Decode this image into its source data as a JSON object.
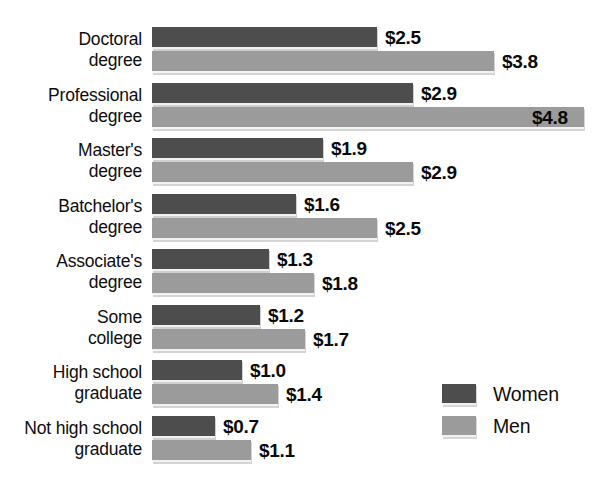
{
  "chart_data": {
    "type": "bar",
    "orientation": "horizontal",
    "title": "",
    "subtitle": "",
    "xlabel": "",
    "ylabel": "",
    "grid": false,
    "xlim": [
      0,
      5.0
    ],
    "value_prefix": "$",
    "categories": [
      "Doctoral\ndegree",
      "Professional\ndegree",
      "Master's\ndegree",
      "Batchelor's\ndegree",
      "Associate's\ndegree",
      "Some\ncollege",
      "High school\ngraduate",
      "Not high school\ngraduate"
    ],
    "series": [
      {
        "name": "Women",
        "color": "#4d4d4d",
        "values": [
          2.5,
          2.9,
          1.9,
          1.6,
          1.3,
          1.2,
          1.0,
          0.7
        ],
        "labels": [
          "$2.5",
          "$2.9",
          "$1.9",
          "$1.6",
          "$1.3",
          "$1.2",
          "$1.0",
          "$0.7"
        ]
      },
      {
        "name": "Men",
        "color": "#9b9b9b",
        "values": [
          3.8,
          4.8,
          2.9,
          2.5,
          1.8,
          1.7,
          1.4,
          1.1
        ],
        "labels": [
          "$3.8",
          "$4.8",
          "$2.9",
          "$2.5",
          "$1.8",
          "$1.7",
          "$1.4",
          "$1.1"
        ]
      }
    ],
    "legend": {
      "position": "bottom-right",
      "entries": [
        {
          "label": "Women",
          "color": "#4d4d4d"
        },
        {
          "label": "Men",
          "color": "#9b9b9b"
        }
      ]
    }
  },
  "rows": [
    {
      "category": "Doctoral\ndegree",
      "women": {
        "label": "$2.5",
        "value": 2.5
      },
      "men": {
        "label": "$3.8",
        "value": 3.8
      }
    },
    {
      "category": "Professional\ndegree",
      "women": {
        "label": "$2.9",
        "value": 2.9
      },
      "men": {
        "label": "$4.8",
        "value": 4.8
      }
    },
    {
      "category": "Master's\ndegree",
      "women": {
        "label": "$1.9",
        "value": 1.9
      },
      "men": {
        "label": "$2.9",
        "value": 2.9
      }
    },
    {
      "category": "Batchelor's\ndegree",
      "women": {
        "label": "$1.6",
        "value": 1.6
      },
      "men": {
        "label": "$2.5",
        "value": 2.5
      }
    },
    {
      "category": "Associate's\ndegree",
      "women": {
        "label": "$1.3",
        "value": 1.3
      },
      "men": {
        "label": "$1.8",
        "value": 1.8
      }
    },
    {
      "category": "Some\ncollege",
      "women": {
        "label": "$1.2",
        "value": 1.2
      },
      "men": {
        "label": "$1.7",
        "value": 1.7
      }
    },
    {
      "category": "High school\ngraduate",
      "women": {
        "label": "$1.0",
        "value": 1.0
      },
      "men": {
        "label": "$1.4",
        "value": 1.4
      }
    },
    {
      "category": "Not high school\ngraduate",
      "women": {
        "label": "$0.7",
        "value": 0.7
      },
      "men": {
        "label": "$1.1",
        "value": 1.1
      }
    }
  ],
  "legend": {
    "women_label": "Women",
    "men_label": "Men"
  },
  "style": {
    "women_color": "#4d4d4d",
    "men_color": "#9b9b9b"
  }
}
